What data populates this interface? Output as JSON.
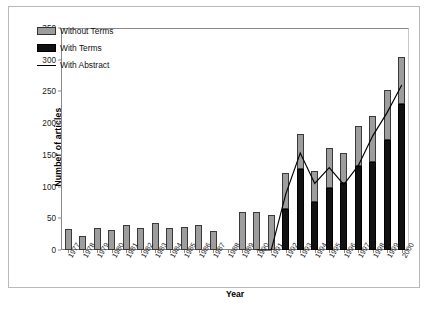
{
  "figure": {
    "y_axis_title": "Number of articles",
    "x_axis_title": "Year"
  },
  "legend": {
    "position": "top-left",
    "items": [
      {
        "label": "Without Terms",
        "marker": "gray-square-swatch",
        "color": "#9d9d9d"
      },
      {
        "label": "With Terms",
        "marker": "black-square-swatch",
        "color": "#111111"
      },
      {
        "label": "With Abstract",
        "marker": "black-line-swatch",
        "color": "#000000"
      }
    ]
  },
  "chart_data": {
    "type": "bar",
    "subtype": "stacked-bar-with-line-overlay",
    "title": "",
    "xlabel": "Year",
    "ylabel": "Number of articles",
    "ylim": [
      0,
      350
    ],
    "yticks": [
      0,
      50,
      100,
      150,
      200,
      250,
      300,
      350
    ],
    "grid": false,
    "legend_position": "top-left",
    "categories": [
      "1977",
      "1978",
      "1979",
      "1980",
      "1981",
      "1982",
      "1983",
      "1984",
      "1985",
      "1986",
      "1987",
      "1988",
      "1989",
      "1990",
      "1991",
      "1992",
      "1993",
      "1994",
      "1995",
      "1996",
      "1997",
      "1998",
      "1999",
      "2000"
    ],
    "series": [
      {
        "name": "With Terms",
        "type": "bar-segment",
        "stack_order": "bottom",
        "color": "#111111",
        "values": [
          0,
          0,
          0,
          0,
          0,
          0,
          0,
          0,
          0,
          0,
          0,
          0,
          0,
          0,
          0,
          65,
          127,
          75,
          97,
          105,
          133,
          138,
          173,
          230
        ]
      },
      {
        "name": "Without Terms",
        "type": "bar-segment",
        "stack_order": "top",
        "color": "#9d9d9d",
        "values": [
          33,
          22,
          35,
          31,
          40,
          34,
          42,
          34,
          36,
          40,
          30,
          0,
          60,
          60,
          55,
          57,
          56,
          50,
          64,
          48,
          62,
          73,
          80,
          75
        ]
      },
      {
        "name": "With Abstract",
        "type": "line",
        "color": "#000000",
        "values": [
          null,
          null,
          null,
          null,
          null,
          null,
          null,
          null,
          null,
          null,
          null,
          null,
          null,
          0,
          0,
          88,
          153,
          105,
          130,
          103,
          133,
          180,
          217,
          260
        ]
      }
    ],
    "bar_totals": [
      33,
      22,
      35,
      31,
      40,
      34,
      42,
      34,
      36,
      40,
      30,
      30,
      60,
      60,
      55,
      122,
      183,
      125,
      161,
      153,
      195,
      211,
      253,
      305
    ]
  }
}
